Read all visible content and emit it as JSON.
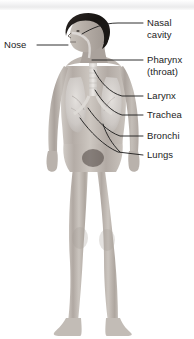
{
  "diagram": {
    "background_color": "#ffffff",
    "line_color": "#1a1a1a",
    "text_color": "#1c1c1c",
    "skin_tone": "#b9b2ac",
    "hair_color": "#1e1a18",
    "organ_overlay_color": "#d9d6d2"
  },
  "labels": [
    {
      "id": "nose",
      "text": "Nose",
      "side": "left",
      "x": 4,
      "y": 40,
      "lines": [
        "Nose"
      ]
    },
    {
      "id": "nasal-cavity",
      "text": "Nasal cavity",
      "side": "right",
      "x": 147,
      "y": 18,
      "lines": [
        "Nasal",
        "cavity"
      ]
    },
    {
      "id": "pharynx",
      "text": "Pharynx (throat)",
      "side": "right",
      "x": 147,
      "y": 55,
      "lines": [
        "Pharynx",
        "(throat)"
      ]
    },
    {
      "id": "larynx",
      "text": "Larynx",
      "side": "right",
      "x": 147,
      "y": 91,
      "lines": [
        "Larynx"
      ]
    },
    {
      "id": "trachea",
      "text": "Trachea",
      "side": "right",
      "x": 147,
      "y": 110,
      "lines": [
        "Trachea"
      ]
    },
    {
      "id": "bronchi",
      "text": "Bronchi",
      "side": "right",
      "x": 147,
      "y": 131,
      "lines": [
        "Bronchi"
      ]
    },
    {
      "id": "lungs",
      "text": "Lungs",
      "side": "right",
      "x": 147,
      "y": 150,
      "lines": [
        "Lungs"
      ]
    }
  ]
}
